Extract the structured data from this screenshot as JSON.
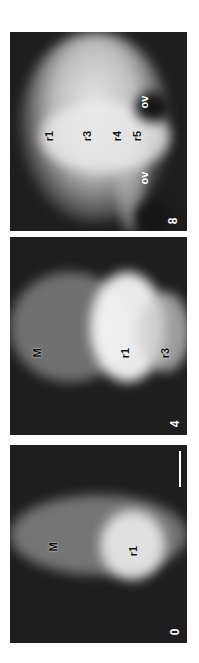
{
  "figure": {
    "panels": [
      {
        "stage": "8",
        "labels": {
          "r1": "r1",
          "r3": "r3",
          "r4": "r4",
          "r5": "r5",
          "ov_left": "ov",
          "ov_right": "ov"
        }
      },
      {
        "stage": "4",
        "labels": {
          "M": "M",
          "r1": "r1",
          "r3": "r3"
        }
      },
      {
        "stage": "0",
        "labels": {
          "M": "M",
          "r1": "r1"
        },
        "scale_bar": true
      }
    ]
  }
}
